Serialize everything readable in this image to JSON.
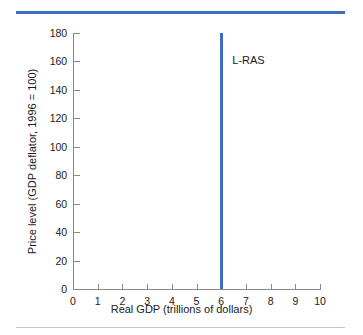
{
  "chart_data": {
    "type": "line",
    "title": "",
    "xlabel": "Real GDP (trillions of dollars)",
    "ylabel": "Price level (GDP deflator, 1996 = 100)",
    "xlim": [
      0,
      10
    ],
    "ylim": [
      0,
      180
    ],
    "xticks": [
      0,
      1,
      2,
      3,
      4,
      5,
      6,
      7,
      8,
      9,
      10
    ],
    "xtick_labels": [
      "0",
      "1",
      "2",
      "3",
      "4",
      "5",
      "6",
      "7",
      "8",
      "9",
      "10"
    ],
    "yticks": [
      0,
      20,
      40,
      60,
      80,
      100,
      120,
      140,
      160,
      180
    ],
    "ytick_labels": [
      "0",
      "20",
      "40",
      "60",
      "80",
      "100",
      "120",
      "140",
      "160",
      "180"
    ],
    "grid": false,
    "legend": "none",
    "series": [
      {
        "name": "L-RAS",
        "kind": "vertical-line",
        "x": 6,
        "y_from": 0,
        "y_to": 180,
        "color": "#3a6fbf",
        "annotation": {
          "text": "L-RAS",
          "x": 6.45,
          "y": 160
        }
      }
    ]
  },
  "decor": {
    "rule_color": "#3a6fbf",
    "rule_bottom_color": "#b9c6da"
  }
}
